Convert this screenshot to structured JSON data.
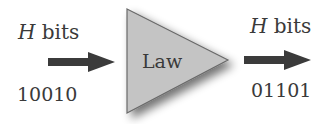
{
  "diagram": {
    "input": {
      "symbol": "H",
      "unit": " bits",
      "value": "10010"
    },
    "law": {
      "label": "Law",
      "fill": "#c4c4c4",
      "stroke": "#666666"
    },
    "output": {
      "symbol": "H",
      "unit": " bits",
      "value": "01101"
    },
    "arrow_color": "#3b3b3b"
  }
}
